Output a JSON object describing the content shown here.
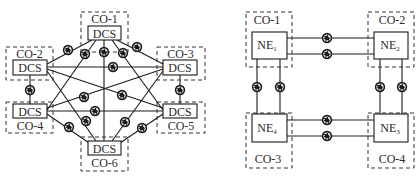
{
  "left_diagram": {
    "name": "mesh-dcs-network",
    "nodes": [
      {
        "id": "CO-1",
        "label": "CO-1",
        "device": "DCS"
      },
      {
        "id": "CO-2",
        "label": "CO-2",
        "device": "DCS"
      },
      {
        "id": "CO-3",
        "label": "CO-3",
        "device": "DCS"
      },
      {
        "id": "CO-4",
        "label": "CO-4",
        "device": "DCS"
      },
      {
        "id": "CO-5",
        "label": "CO-5",
        "device": "DCS"
      },
      {
        "id": "CO-6",
        "label": "CO-6",
        "device": "DCS"
      }
    ],
    "links_note": "full mesh; each link has a fiber spool icon",
    "link_icon": "fiber-spool-icon"
  },
  "right_diagram": {
    "name": "ring-ne-network",
    "nodes": [
      {
        "id": "CO-1",
        "label": "CO-1",
        "device": "NE",
        "sub": "1"
      },
      {
        "id": "CO-2",
        "label": "CO-2",
        "device": "NE",
        "sub": "2"
      },
      {
        "id": "CO-3",
        "label": "CO-3",
        "device": "NE",
        "sub": "4"
      },
      {
        "id": "CO-4",
        "label": "CO-4",
        "device": "NE",
        "sub": "3"
      }
    ],
    "links_note": "dual fiber links between adjacent NEs in a ring",
    "link_icon": "fiber-spool-icon"
  },
  "colors": {
    "line": "#1a1a1a",
    "dashed": "#333333",
    "background": "#ffffff"
  }
}
